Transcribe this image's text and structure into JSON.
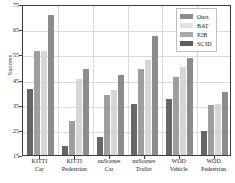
{
  "chart_data": {
    "type": "bar",
    "title": "",
    "xlabel": "",
    "ylabel": "Success",
    "ylim": [
      15,
      75
    ],
    "yticks": [
      15,
      25,
      35,
      45,
      55,
      65,
      75
    ],
    "grid": true,
    "legend_position": "upper right",
    "categories": [
      "KITTI Car",
      "KITTI Pedestrian",
      "nuScenes Car",
      "nuScenes Trailer",
      "WOD Vehicle",
      "WOD Pedestrian"
    ],
    "category_lines": [
      [
        "KITTI",
        "Car"
      ],
      [
        "KITTI",
        "Pedestrian"
      ],
      [
        "nuScenes",
        "Car"
      ],
      [
        "nuScenes",
        "Trailer"
      ],
      [
        "WOD",
        "Vehicle"
      ],
      [
        "WOD",
        "Pedestrian"
      ]
    ],
    "series": [
      {
        "name": "SC3D",
        "color": "#666666",
        "values": [
          41.3,
          18.5,
          22.1,
          35.2,
          37.3,
          24.4
        ]
      },
      {
        "name": "P2B",
        "color": "#9e9e9e",
        "values": [
          56.2,
          28.6,
          38.8,
          49.0,
          46.1,
          35.0
        ]
      },
      {
        "name": "BAT",
        "color": "#d6d6d6",
        "values": [
          56.2,
          45.4,
          40.7,
          52.6,
          50.0,
          35.4
        ]
      },
      {
        "name": "Ours",
        "color": "#8c8c8c",
        "values": [
          70.6,
          49.0,
          46.9,
          62.2,
          53.7,
          40.1
        ]
      }
    ],
    "bar_order_left_to_right": [
      "SC3D",
      "P2B",
      "BAT",
      "Ours"
    ]
  },
  "legend": {
    "items": [
      {
        "label": "Ours",
        "color": "#8c8c8c"
      },
      {
        "label": "BAT",
        "color": "#e2e2e2"
      },
      {
        "label": "P2B",
        "color": "#a8a8a8"
      },
      {
        "label": "SC3D",
        "color": "#5e5e5e"
      }
    ]
  }
}
